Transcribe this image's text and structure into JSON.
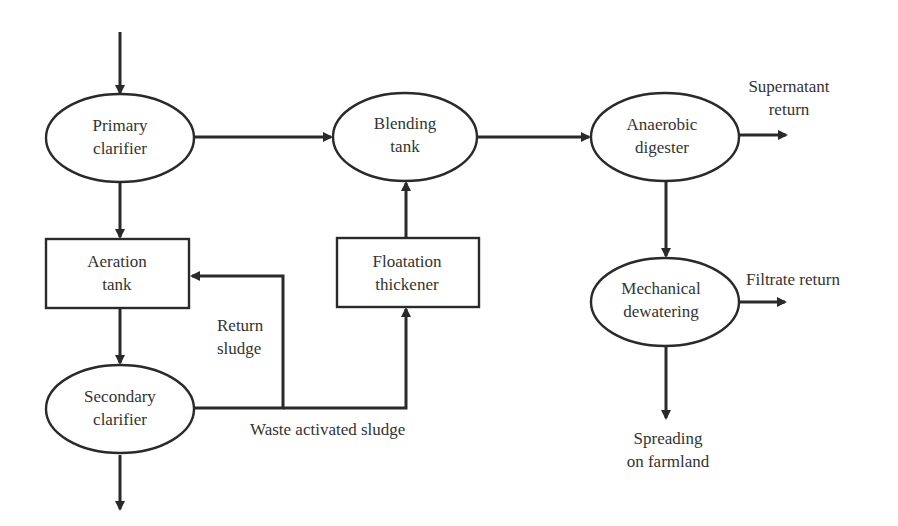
{
  "diagram": {
    "colors": {
      "stroke": "#2a2a2a",
      "text": "#333333",
      "background": "#ffffff"
    },
    "nodes": {
      "primary_clarifier": {
        "shape": "ellipse",
        "line1": "Primary",
        "line2": "clarifier"
      },
      "aeration_tank": {
        "shape": "rectangle",
        "line1": "Aeration",
        "line2": "tank"
      },
      "secondary_clarifier": {
        "shape": "ellipse",
        "line1": "Secondary",
        "line2": "clarifier"
      },
      "blending_tank": {
        "shape": "ellipse",
        "line1": "Blending",
        "line2": "tank"
      },
      "floatation_thickener": {
        "shape": "rectangle",
        "line1": "Floatation",
        "line2": "thickener"
      },
      "anaerobic_digester": {
        "shape": "ellipse",
        "line1": "Anaerobic",
        "line2": "digester"
      },
      "mechanical_dewatering": {
        "shape": "ellipse",
        "line1": "Mechanical",
        "line2": "dewatering"
      }
    },
    "edge_labels": {
      "return_sludge": {
        "line1": "Return",
        "line2": "sludge"
      },
      "waste_activated_sludge": "Waste activated sludge",
      "supernatant_return": {
        "line1": "Supernatant",
        "line2": "return"
      },
      "filtrate_return": "Filtrate return",
      "spreading_on_farmland": {
        "line1": "Spreading",
        "line2": "on farmland"
      }
    },
    "edges": [
      {
        "from": "influent",
        "to": "primary_clarifier"
      },
      {
        "from": "primary_clarifier",
        "to": "aeration_tank"
      },
      {
        "from": "primary_clarifier",
        "to": "blending_tank"
      },
      {
        "from": "aeration_tank",
        "to": "secondary_clarifier"
      },
      {
        "from": "secondary_clarifier",
        "to": "effluent"
      },
      {
        "from": "secondary_clarifier",
        "to": "aeration_tank",
        "label": "Return sludge"
      },
      {
        "from": "secondary_clarifier",
        "to": "floatation_thickener",
        "label": "Waste activated sludge"
      },
      {
        "from": "floatation_thickener",
        "to": "blending_tank"
      },
      {
        "from": "blending_tank",
        "to": "anaerobic_digester"
      },
      {
        "from": "anaerobic_digester",
        "to": "supernatant_return"
      },
      {
        "from": "anaerobic_digester",
        "to": "mechanical_dewatering"
      },
      {
        "from": "mechanical_dewatering",
        "to": "filtrate_return"
      },
      {
        "from": "mechanical_dewatering",
        "to": "spreading_on_farmland"
      }
    ]
  }
}
